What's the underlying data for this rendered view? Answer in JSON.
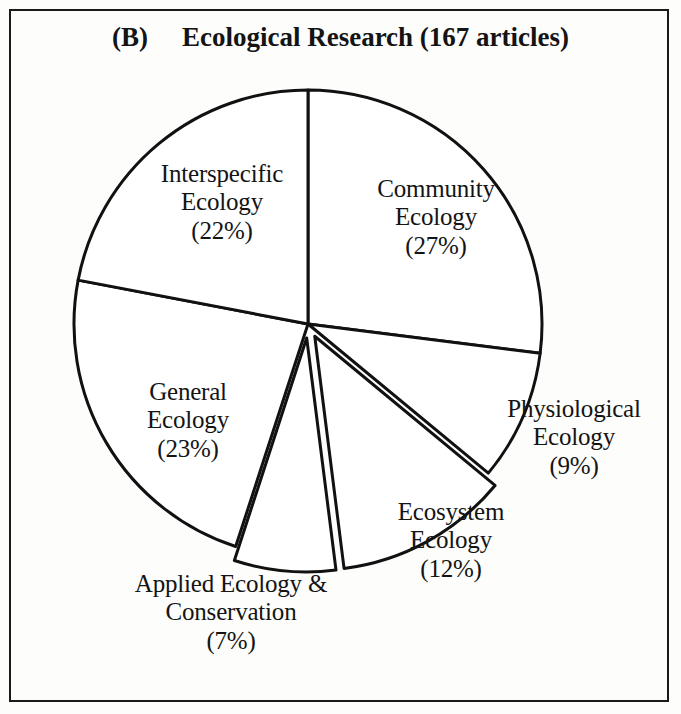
{
  "figure": {
    "panel_letter": "(B)",
    "title": "Ecological Research (167 articles)"
  },
  "chart_data": {
    "type": "pie",
    "title": "Ecological Research (167 articles)",
    "panel": "(B)",
    "total_articles": 167,
    "units": "percent",
    "start_angle_deg": 0,
    "direction": "clockwise",
    "legend": "none (direct labels)",
    "grid": false,
    "categories": [
      "Community Ecology",
      "Physiological Ecology",
      "Ecosystem Ecology",
      "Applied Ecology & Conservation",
      "General Ecology",
      "Interspecific Ecology"
    ],
    "values": [
      27,
      9,
      12,
      7,
      23,
      22
    ],
    "slices": [
      {
        "name": "Community Ecology",
        "label_line1": "Community",
        "label_line2": "Ecology",
        "label_value": "(27%)",
        "value": 27,
        "exploded": false,
        "start_deg": 0,
        "end_deg": 97.2
      },
      {
        "name": "Physiological Ecology",
        "label_line1": "Physiological",
        "label_line2": "Ecology",
        "label_value": "(9%)",
        "value": 9,
        "exploded": false,
        "start_deg": 97.2,
        "end_deg": 129.6
      },
      {
        "name": "Ecosystem Ecology",
        "label_line1": "Ecosystem",
        "label_line2": "Ecology",
        "label_value": "(12%)",
        "value": 12,
        "exploded": true,
        "start_deg": 129.6,
        "end_deg": 172.8
      },
      {
        "name": "Applied Ecology & Conservation",
        "label_line1": "Applied Ecology &",
        "label_line2": "Conservation",
        "label_value": "(7%)",
        "value": 7,
        "exploded": true,
        "start_deg": 172.8,
        "end_deg": 198.0
      },
      {
        "name": "General Ecology",
        "label_line1": "General",
        "label_line2": "Ecology",
        "label_value": "(23%)",
        "value": 23,
        "exploded": false,
        "start_deg": 198.0,
        "end_deg": 280.8
      },
      {
        "name": "Interspecific Ecology",
        "label_line1": "Interspecific",
        "label_line2": "Ecology",
        "label_value": "(22%)",
        "value": 22,
        "exploded": false,
        "start_deg": 280.8,
        "end_deg": 360
      }
    ],
    "style": {
      "fill": "#ffffff",
      "stroke": "#111111",
      "stroke_width": 3,
      "center_x": 308,
      "center_y": 324,
      "radius": 234
    }
  }
}
